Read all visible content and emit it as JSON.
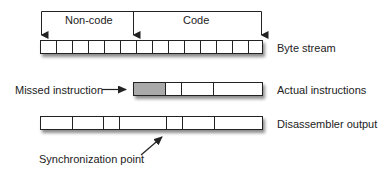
{
  "diagram": {
    "top_bracket": {
      "labels": {
        "non_code": "Non-code",
        "code": "Code"
      }
    },
    "rows": {
      "byte_stream": {
        "label": "Byte stream",
        "cell_count": 14
      },
      "actual_instructions": {
        "label": "Actual instructions",
        "segments": [
          {
            "width_bytes": 2,
            "type": "missed"
          },
          {
            "width_bytes": 1,
            "type": "normal"
          },
          {
            "width_bytes": 2,
            "type": "normal"
          },
          {
            "width_bytes": 3,
            "type": "normal"
          }
        ]
      },
      "disassembler_output": {
        "label": "Disassembler output",
        "segments": [
          {
            "width_bytes": 2
          },
          {
            "width_bytes": 2
          },
          {
            "width_bytes": 1
          },
          {
            "width_bytes": 3
          },
          {
            "width_bytes": 1
          },
          {
            "width_bytes": 2
          },
          {
            "width_bytes": 3
          }
        ]
      }
    },
    "annotations": {
      "missed_instruction": "Missed instruction",
      "synchronization_point": "Synchronization point"
    },
    "colors": {
      "line": "#222222",
      "missed_fill": "#a9a9a9",
      "cell_fill": "#ffffff"
    }
  }
}
